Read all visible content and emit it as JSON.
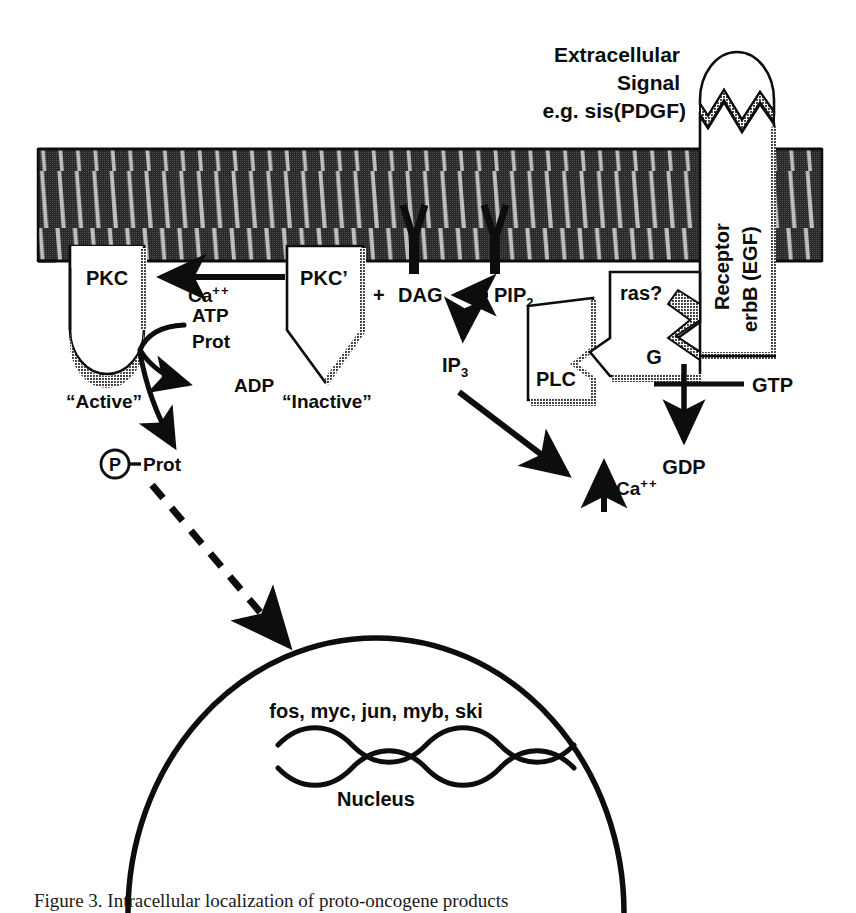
{
  "figure": {
    "domain": "cell-signaling-pathway-diagram",
    "caption": "Figure 3. Intracellular localization of proto-oncogene products",
    "colors": {
      "ink": "#0d0d0d",
      "membrane_dark": "#2b2b2b",
      "membrane_light": "#d9d9d9",
      "shadow_gray": "#8c8c8c",
      "background": "#ffffff"
    }
  },
  "extracellular": {
    "signal_label_line1": "Extracellular",
    "signal_label_line2": "Signal",
    "signal_label_line3": "e.g. sis(PDGF)",
    "ligand_name": "sis-PDGF-ligand"
  },
  "receptor": {
    "label_line1": "Receptor",
    "label_line2": "erbB (EGF)"
  },
  "membrane": {
    "name": "plasma-membrane-lipid-bilayer",
    "stripe_count": 46
  },
  "pkc_active": {
    "label": "PKC",
    "state_label": "“Active”"
  },
  "pkc_inactive": {
    "label": "PKC’",
    "state_label": "“Inactive”"
  },
  "calcium_flux": {
    "label_base": "Ca",
    "label_charge": "++"
  },
  "kinase_reaction": {
    "substrate_line1": "ATP",
    "substrate_line2": "Prot",
    "product": "ADP",
    "phospho_circle": "P",
    "phospho_dash": "-",
    "phospho_target": "Prot"
  },
  "lipid_signaling": {
    "plus": "+",
    "dag": "DAG",
    "pip2_base": "PIP",
    "pip2_sub": "2",
    "ip3_base": "IP",
    "ip3_sub": "3",
    "calcium_base": "Ca",
    "calcium_charge": "++"
  },
  "plc": {
    "label": "PLC"
  },
  "g_protein": {
    "label": "G",
    "ras_label": "ras?",
    "gtp": "GTP",
    "gdp": "GDP"
  },
  "nucleus": {
    "genes_label": "fos, myc, jun, myb, ski",
    "label": "Nucleus",
    "dna_name": "dna-double-helix"
  }
}
